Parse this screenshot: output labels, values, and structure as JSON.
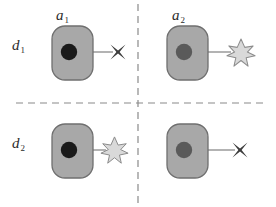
{
  "figure": {
    "title": "",
    "width": 276,
    "height": 207,
    "background": "#ffffff",
    "layout": "2x2 quadrant grid separated by dashed divider lines",
    "dividers": {
      "vertical_x": 138,
      "horizontal_y": 103,
      "style": "dashed",
      "color": "#8a8a8a"
    }
  },
  "labels": {
    "column_1": {
      "base": "a",
      "sub": "1",
      "text": "a1"
    },
    "column_2": {
      "base": "a",
      "sub": "2",
      "text": "a2"
    },
    "row_1": {
      "base": "d",
      "sub": "1",
      "text": "d1"
    },
    "row_2": {
      "base": "d",
      "sub": "2",
      "text": "d2"
    }
  },
  "colors": {
    "cell_fill": "#a8a8a8",
    "cell_stroke": "#6f6f6f",
    "nucleus_fill": "#1a1a1a",
    "nucleus_fill_muted": "#5a5a5a",
    "arrow_stroke": "#9a9a9a",
    "star_fill": "#d9d9d9",
    "star_stroke": "#8c8c8c",
    "cross_fill": "#3c3c3c",
    "divider": "#8a8a8a",
    "label_text": "#2b2b2b"
  },
  "quadrants": [
    {
      "id": "q-d1-a1",
      "row_label": "d1",
      "column_label": "a1",
      "cell": {
        "name": "rounded-rect-cell",
        "x": 52,
        "y": 26,
        "width": 41,
        "height": 54,
        "radius": 13
      },
      "nucleus": {
        "name": "nucleus-dot",
        "cx": 69,
        "cy": 52,
        "r": 8,
        "tone": "dark"
      },
      "arrow": {
        "name": "arrow-connector",
        "x1": 70,
        "y1": 52,
        "x2": 115,
        "y2": 52
      },
      "outcome": {
        "name": "cross-marker",
        "glyph": "cross",
        "cx": 118,
        "cy": 52
      }
    },
    {
      "id": "q-d1-a2",
      "row_label": "d1",
      "column_label": "a2",
      "cell": {
        "name": "rounded-rect-cell",
        "x": 167,
        "y": 26,
        "width": 41,
        "height": 54,
        "radius": 13
      },
      "nucleus": {
        "name": "nucleus-dot",
        "cx": 184,
        "cy": 52,
        "r": 8,
        "tone": "muted"
      },
      "arrow": {
        "name": "arrow-connector",
        "x1": 185,
        "y1": 52,
        "x2": 230,
        "y2": 52
      },
      "outcome": {
        "name": "starburst-marker",
        "glyph": "starburst",
        "cx": 240,
        "cy": 53
      }
    },
    {
      "id": "q-d2-a1",
      "row_label": "d2",
      "column_label": "a1",
      "cell": {
        "name": "rounded-rect-cell",
        "x": 52,
        "y": 124,
        "width": 41,
        "height": 54,
        "radius": 13
      },
      "nucleus": {
        "name": "nucleus-dot",
        "cx": 69,
        "cy": 150,
        "r": 8,
        "tone": "dark"
      },
      "arrow": {
        "name": "arrow-connector",
        "x1": 70,
        "y1": 150,
        "x2": 104,
        "y2": 150
      },
      "outcome": {
        "name": "starburst-marker",
        "glyph": "starburst",
        "cx": 114,
        "cy": 150
      }
    },
    {
      "id": "q-d2-a2",
      "row_label": "d2",
      "column_label": "a2",
      "cell": {
        "name": "rounded-rect-cell",
        "x": 167,
        "y": 124,
        "width": 41,
        "height": 54,
        "radius": 13
      },
      "nucleus": {
        "name": "nucleus-dot",
        "cx": 184,
        "cy": 150,
        "r": 8,
        "tone": "muted"
      },
      "arrow": {
        "name": "arrow-connector",
        "x1": 185,
        "y1": 150,
        "x2": 236,
        "y2": 150
      },
      "outcome": {
        "name": "cross-marker",
        "glyph": "cross",
        "cx": 240,
        "cy": 150
      }
    }
  ],
  "label_positions": {
    "a1": {
      "left": 56,
      "top": 8
    },
    "a2": {
      "left": 172,
      "top": 8
    },
    "d1": {
      "left": 12,
      "top": 36
    },
    "d2": {
      "left": 12,
      "top": 134
    }
  }
}
